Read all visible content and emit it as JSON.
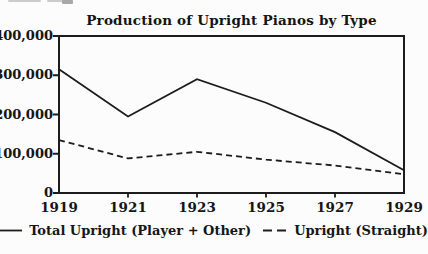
{
  "colors": {
    "background": "#fcfcfc",
    "ink": "#1c1c1c"
  },
  "chart_data": {
    "type": "line",
    "title": "Production of Upright Pianos by Type",
    "x": [
      1919,
      1921,
      1923,
      1925,
      1927,
      1929
    ],
    "x_labels": [
      "1919",
      "1921",
      "1923",
      "1925",
      "1927",
      "1929"
    ],
    "xlabel": "",
    "ylabel": "",
    "ylim": [
      0,
      400000
    ],
    "yticks": [
      {
        "value": 400000,
        "label": "400,000"
      },
      {
        "value": 300000,
        "label": "300,000"
      },
      {
        "value": 200000,
        "label": "200,000"
      },
      {
        "value": 100000,
        "label": "100,000"
      },
      {
        "value": 0,
        "label": "0"
      }
    ],
    "grid": false,
    "legend_position": "bottom",
    "series": [
      {
        "name": "Total Upright (Player + Other)",
        "line_style": "solid",
        "values": [
          315000,
          195000,
          290000,
          230000,
          155000,
          58000
        ]
      },
      {
        "name": "Upright (Straight)",
        "line_style": "dashed",
        "values": [
          135000,
          88000,
          105000,
          85000,
          70000,
          48000
        ]
      }
    ]
  }
}
